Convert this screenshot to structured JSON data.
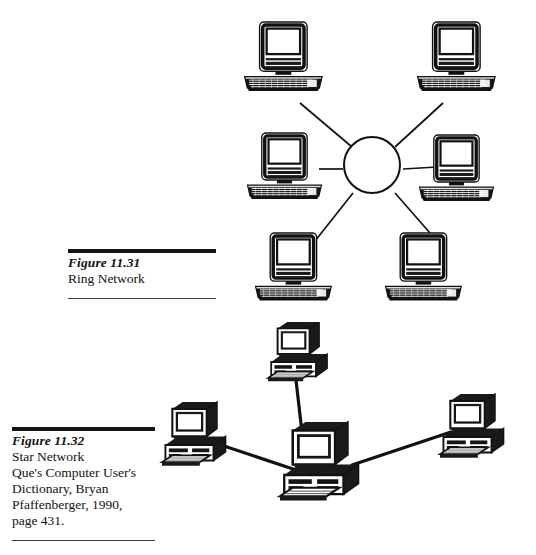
{
  "page": {
    "width": 536,
    "height": 555,
    "background": "#ffffff",
    "ink": "#141414"
  },
  "figures": [
    {
      "id": "ring-network",
      "number": "Figure 11.31",
      "title": "Ring Network",
      "source_lines": [],
      "diagram": {
        "type": "network-topology",
        "hub": {
          "shape": "circle",
          "cx": 371,
          "cy": 164,
          "r": 27
        },
        "node_icon": "desktop-computer-macintosh",
        "node_count": 6,
        "nodes": [
          {
            "label": "workstation-top-left",
            "x": 242,
            "y": 22,
            "w": 94,
            "h": 78
          },
          {
            "label": "workstation-top-right",
            "x": 418,
            "y": 22,
            "w": 94,
            "h": 78
          },
          {
            "label": "workstation-middle-left",
            "x": 247,
            "y": 130,
            "w": 94,
            "h": 78
          },
          {
            "label": "workstation-middle-right",
            "x": 418,
            "y": 132,
            "w": 94,
            "h": 78
          },
          {
            "label": "workstation-bottom-left",
            "x": 252,
            "y": 232,
            "w": 94,
            "h": 78
          },
          {
            "label": "workstation-bottom-right",
            "x": 382,
            "y": 232,
            "w": 94,
            "h": 78
          }
        ],
        "links": [
          {
            "from": "workstation-top-left",
            "to": "hub"
          },
          {
            "from": "workstation-top-right",
            "to": "hub"
          },
          {
            "from": "workstation-middle-left",
            "to": "hub"
          },
          {
            "from": "workstation-middle-right",
            "to": "hub"
          },
          {
            "from": "workstation-bottom-left",
            "to": "hub"
          },
          {
            "from": "workstation-bottom-right",
            "to": "hub"
          }
        ]
      }
    },
    {
      "id": "star-network",
      "number": "Figure 11.32",
      "title": "Star Network",
      "source_lines": [
        "Que's Computer User's",
        "Dictionary, Bryan",
        "Pfaffenberger, 1990,",
        "page 431."
      ],
      "diagram": {
        "type": "network-topology",
        "node_icon": "desktop-computer-pc-isometric",
        "node_count": 4,
        "nodes": [
          {
            "label": "server-center",
            "x": 300,
            "y": 442,
            "w": 92,
            "h": 88,
            "role": "center"
          },
          {
            "label": "workstation-top",
            "x": 286,
            "y": 327,
            "w": 72,
            "h": 68,
            "role": "leaf"
          },
          {
            "label": "workstation-left",
            "x": 168,
            "y": 418,
            "w": 76,
            "h": 70,
            "role": "leaf"
          },
          {
            "label": "workstation-right",
            "x": 444,
            "y": 405,
            "w": 78,
            "h": 72,
            "role": "leaf"
          }
        ],
        "links": [
          {
            "from": "workstation-top",
            "to": "server-center"
          },
          {
            "from": "workstation-left",
            "to": "server-center"
          },
          {
            "from": "workstation-right",
            "to": "server-center"
          }
        ]
      }
    }
  ]
}
